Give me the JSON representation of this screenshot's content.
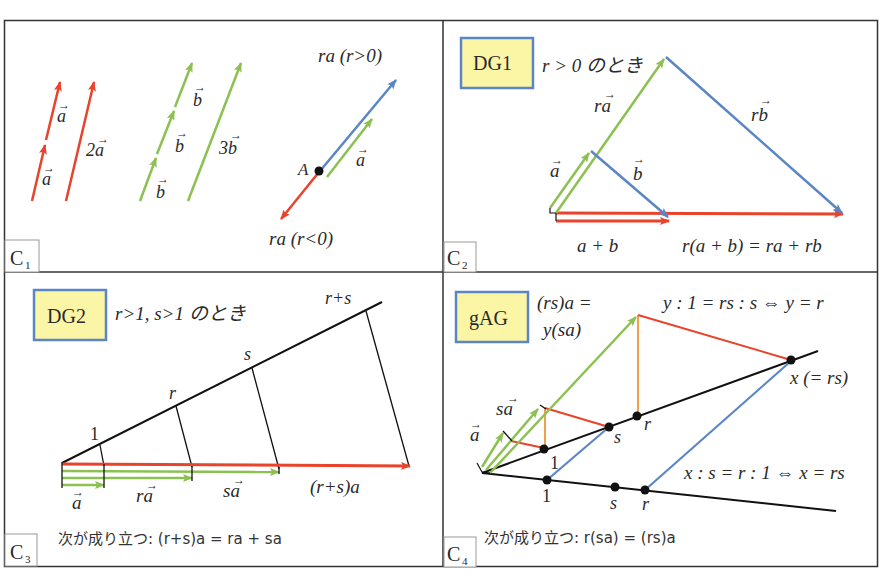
{
  "colors": {
    "red": "#e8432b",
    "green": "#8cc152",
    "blue": "#5b86c5",
    "orange": "#f0a04b",
    "black": "#1a1a1a",
    "tag_fill": "#fbf5a6",
    "tag_border": "#5b86c5",
    "frame": "#333333"
  },
  "panels": {
    "c1": {
      "corner_label": "C",
      "corner_sub": "1",
      "labels": {
        "a_lower": "a",
        "a_upper": "a",
        "two_a": "2a",
        "b_lower": "b",
        "b_mid": "b",
        "b_upper": "b",
        "three_b": "3b",
        "point_A": "A",
        "a_green": "a",
        "ra_pos": "ra (r>0)",
        "ra_neg": "ra (r<0)"
      }
    },
    "c2": {
      "corner_label": "C",
      "corner_sub": "2",
      "tag": "DG1",
      "condition": "r > 0 のとき",
      "labels": {
        "ra": "ra",
        "rb": "rb",
        "a": "a",
        "b": "b",
        "a_plus_b": "a + b",
        "identity": "r(a + b) = ra + rb"
      }
    },
    "c3": {
      "corner_label": "C",
      "corner_sub": "3",
      "tag": "DG2",
      "condition": "r>1, s>1 のとき",
      "tick_labels": [
        "1",
        "r",
        "s",
        "r+s"
      ],
      "labels": {
        "a": "a",
        "ra": "ra",
        "sa": "sa",
        "rsa": "(r+s)a"
      },
      "conclusion": "次が成り立つ: (r+s)a = ra + sa"
    },
    "c4": {
      "corner_label": "C",
      "corner_sub": "4",
      "tag": "gAG",
      "eq_line1": "(rs)a =",
      "eq_line2": "y(sa)",
      "ratio_y": "y : 1 = rs : s  ⇔  y = r",
      "ratio_x": "x : s = r : 1 ⇔ x = rs",
      "x_label": "x (= rs)",
      "upper_points": [
        "1",
        "s",
        "r"
      ],
      "lower_points": [
        "1",
        "s",
        "r"
      ],
      "labels": {
        "a": "a",
        "sa": "sa"
      },
      "conclusion": "次が成り立つ:  r(sa) = (rs)a"
    }
  }
}
